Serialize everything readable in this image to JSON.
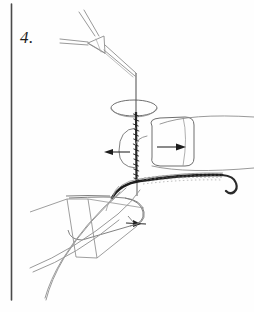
{
  "figure": {
    "label": "4.",
    "domain_kind": "surgical-technique-line-drawing",
    "background_color": "#fefefe",
    "ink_color": "#3a3a3a",
    "ink_color_light": "#8d8d8d",
    "ink_color_dark": "#1d1d1d",
    "border_rule": {
      "name": "left-vertical-rule",
      "x": 11,
      "y_start": 4,
      "y_end": 300,
      "color": "#4a4a4a",
      "width": 1.6
    },
    "annotations": {
      "step_number": "4.",
      "arrow_left_label": "",
      "arrow_right_upper_label": "",
      "arrow_right_lower_label": ""
    },
    "elements": [
      {
        "name": "needle-holder-instrument",
        "description": "forceps with triangular jaw body and two handle arms"
      },
      {
        "name": "suture-thread-vertical",
        "description": "vertical thread with dense hatched midsection"
      },
      {
        "name": "suture-loop-ellipse",
        "description": "horizontal ellipse loop around thread"
      },
      {
        "name": "tissue-block-rounded-rect",
        "description": "rounded rectangle with right-pointing arrow"
      },
      {
        "name": "flap-edge-curve",
        "description": "thick dark curve with stippled suture line"
      },
      {
        "name": "lower-flap-outline",
        "description": "elongated rounded flap shape lower-left"
      },
      {
        "name": "parallelogram-guide",
        "description": "quadrilateral construction guide"
      },
      {
        "name": "long-contour-curves",
        "description": "two long crossing contour lines"
      },
      {
        "name": "arrow-left-traction",
        "description": "arrow pointing left mid-figure"
      },
      {
        "name": "arrow-right-tissue",
        "description": "arrow pointing right inside tissue block"
      },
      {
        "name": "arrow-right-lower",
        "description": "arrow pointing right lower-left region"
      }
    ]
  }
}
